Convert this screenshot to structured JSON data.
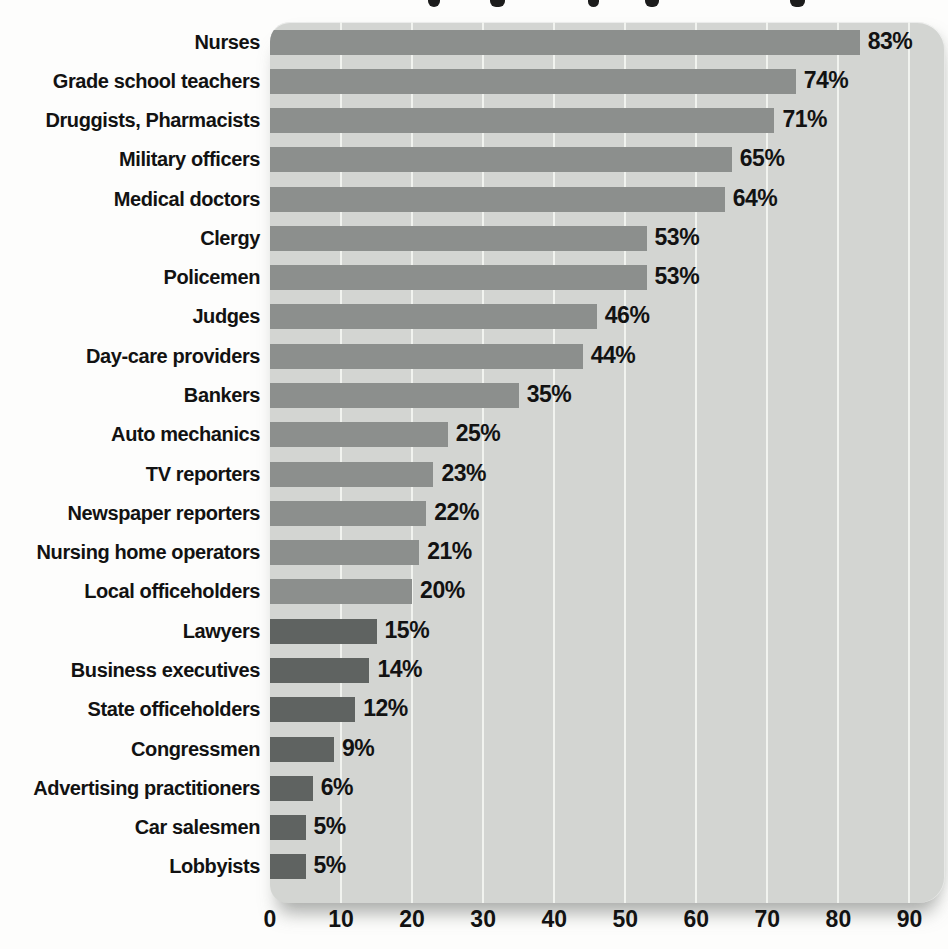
{
  "chart_data": {
    "type": "bar",
    "orientation": "horizontal",
    "title": "",
    "xlabel": "",
    "ylabel": "",
    "categories": [
      "Nurses",
      "Grade school teachers",
      "Druggists, Pharmacists",
      "Military officers",
      "Medical doctors",
      "Clergy",
      "Policemen",
      "Judges",
      "Day-care providers",
      "Bankers",
      "Auto mechanics",
      "TV reporters",
      "Newspaper reporters",
      "Nursing home operators",
      "Local officeholders",
      "Lawyers",
      "Business executives",
      "State officeholders",
      "Congressmen",
      "Advertising practitioners",
      "Car salesmen",
      "Lobbyists"
    ],
    "values": [
      83,
      74,
      71,
      65,
      64,
      53,
      53,
      46,
      44,
      35,
      25,
      23,
      22,
      21,
      20,
      15,
      14,
      12,
      9,
      6,
      5,
      5
    ],
    "value_labels": [
      "83%",
      "74%",
      "71%",
      "65%",
      "64%",
      "53%",
      "53%",
      "46%",
      "44%",
      "35%",
      "25%",
      "23%",
      "22%",
      "21%",
      "20%",
      "15%",
      "14%",
      "12%",
      "9%",
      "6%",
      "5%",
      "5%"
    ],
    "tones": [
      "medium",
      "medium",
      "medium",
      "medium",
      "medium",
      "medium",
      "medium",
      "medium",
      "medium",
      "medium",
      "medium",
      "medium",
      "medium",
      "medium",
      "medium",
      "dark",
      "dark",
      "dark",
      "dark",
      "dark",
      "dark",
      "dark"
    ],
    "tone_colors": {
      "medium": "#8c8f8d",
      "dark": "#5f6361"
    },
    "xticks": [
      0,
      10,
      20,
      30,
      40,
      50,
      60,
      70,
      80,
      90
    ],
    "xlim": [
      0,
      95
    ],
    "grid": "vertical-white-lines",
    "legend": "none"
  },
  "style": {
    "panel_bg": "#d3d5d2",
    "gridline_color": "#f1f3ef",
    "text_color": "#121212",
    "page_bg": "#fdfdfc"
  },
  "cropped_title": {
    "marks": [
      {
        "x": 428,
        "w": 12
      },
      {
        "x": 490,
        "w": 15
      },
      {
        "x": 588,
        "w": 11
      },
      {
        "x": 645,
        "w": 14
      },
      {
        "x": 790,
        "w": 15
      }
    ]
  }
}
